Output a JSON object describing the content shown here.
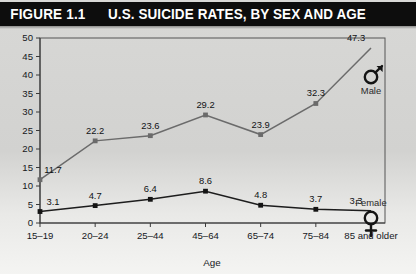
{
  "header": {
    "figure_number": "FIGURE 1.1",
    "figure_title": "U.S. SUICIDE RATES, BY SEX AND AGE"
  },
  "chart_data": {
    "type": "line",
    "title": "U.S. SUICIDE RATES, BY SEX AND AGE",
    "xlabel": "Age",
    "ylabel": "",
    "categories": [
      "15–19",
      "20–24",
      "25–44",
      "45–64",
      "65–74",
      "75–84",
      "85 and older"
    ],
    "ylim": [
      0,
      50
    ],
    "ytick_labels": [
      "0",
      "5",
      "10",
      "15",
      "20",
      "25",
      "30",
      "35",
      "40",
      "45",
      "50"
    ],
    "ytick_values": [
      0,
      5,
      10,
      15,
      20,
      25,
      30,
      35,
      40,
      45,
      50
    ],
    "grid": false,
    "legend_position": "inline-end-of-line",
    "series": [
      {
        "name": "Male",
        "color": "#6b6b6b",
        "marker": "square",
        "end_symbol": "male-symbol",
        "values": [
          11.7,
          22.2,
          23.6,
          29.2,
          23.9,
          32.3,
          47.3
        ],
        "labels": [
          "11.7",
          "22.2",
          "23.6",
          "29.2",
          "23.9",
          "32.3",
          "47.3"
        ]
      },
      {
        "name": "Female",
        "color": "#141414",
        "marker": "square",
        "end_symbol": "female-symbol",
        "values": [
          3.1,
          4.7,
          6.4,
          8.6,
          4.8,
          3.7,
          3.3
        ],
        "labels": [
          "3.1",
          "4.7",
          "6.4",
          "8.6",
          "4.8",
          "3.7",
          "3.3"
        ]
      }
    ]
  }
}
